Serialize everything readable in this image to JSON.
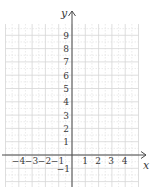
{
  "figure": {
    "type": "coordinate-grid",
    "axes": {
      "x_label": "x",
      "y_label": "y",
      "x_ticks": [
        "−4",
        "−3",
        "−2",
        "−1",
        "1",
        "2",
        "3",
        "4"
      ],
      "y_ticks": [
        "9",
        "8",
        "7",
        "6",
        "5",
        "4",
        "3",
        "2",
        "1",
        "−1"
      ]
    },
    "grid": {
      "x_range": [
        -5,
        5
      ],
      "y_range": [
        -2,
        10
      ],
      "major_step": 1,
      "minor_step": 0.5,
      "major_color": "#d6d6d6",
      "minor_color": "#e6e6e6",
      "axis_color": "#4a4a4a"
    }
  },
  "chart_data": {
    "type": "scatter",
    "title": "",
    "xlabel": "x",
    "ylabel": "y",
    "xlim": [
      -5,
      5
    ],
    "ylim": [
      -2,
      10
    ],
    "x_tick_labels": [
      -4,
      -3,
      -2,
      -1,
      1,
      2,
      3,
      4
    ],
    "y_tick_labels": [
      -1,
      1,
      2,
      3,
      4,
      5,
      6,
      7,
      8,
      9
    ],
    "grid": true,
    "series": []
  }
}
